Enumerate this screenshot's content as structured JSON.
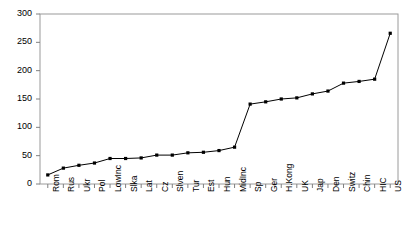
{
  "chart_data": {
    "type": "line",
    "title": "",
    "subtitle": "",
    "xlabel": "",
    "ylabel": "",
    "categories": [
      "Rom",
      "Rus",
      "Ukr",
      "Pol",
      "LowInc",
      "Slka",
      "Lat",
      "Cz",
      "Slven",
      "Tur",
      "Est",
      "Hun",
      "MidInc",
      "Sp",
      "Ger",
      "H.Kong",
      "UK",
      "Jap",
      "Den",
      "Switz",
      "Chin",
      "HIC",
      "US"
    ],
    "values": [
      16,
      28,
      33,
      37,
      45,
      45,
      46,
      51,
      51,
      55,
      56,
      59,
      65,
      141,
      145,
      150,
      152,
      159,
      164,
      178,
      181,
      185,
      266
    ],
    "ylim": [
      0,
      300
    ],
    "yticks": [
      0,
      50,
      100,
      150,
      200,
      250,
      300
    ],
    "ytick_labels": [
      "0",
      "50",
      "100",
      "150",
      "200",
      "250",
      "300"
    ],
    "grid": false,
    "legend": null,
    "legend_position": "none",
    "marker": "square",
    "series_color": "#000000",
    "axis_color": "#808080",
    "background_color": "#ffffff"
  }
}
